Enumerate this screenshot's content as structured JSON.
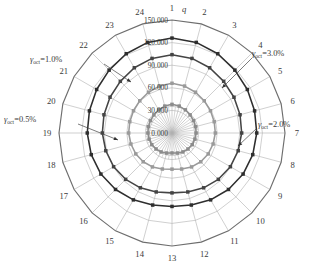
{
  "chart_data": {
    "type": "line",
    "subtype": "polar-radar",
    "title": "",
    "radial_axis_label": "q",
    "radial_ticks": [
      "0.000",
      "30.000",
      "60.000",
      "90.000",
      "120.000",
      "150.000"
    ],
    "radial_tick_values": [
      0,
      30000,
      60000,
      90000,
      120000,
      150000
    ],
    "rlim": [
      0,
      150000
    ],
    "grid": true,
    "legend_position": "annotations-on-plot",
    "angular_axis_label": "",
    "categories": [
      "1",
      "2",
      "3",
      "4",
      "5",
      "6",
      "7",
      "8",
      "9",
      "10",
      "11",
      "12",
      "13",
      "14",
      "15",
      "16",
      "17",
      "18",
      "19",
      "20",
      "21",
      "22",
      "23",
      "24"
    ],
    "angle_start_deg": 90,
    "angle_direction": "clockwise",
    "series": [
      {
        "name": "γoct=0.5%",
        "label_text": "=0.5%",
        "symbol": "γ",
        "subscript": "oct",
        "color": "#8c8c8c",
        "marker": "square",
        "values": [
          38000,
          37000,
          35500,
          34000,
          33000,
          32500,
          32000,
          31500,
          31000,
          30000,
          29000,
          27500,
          26500,
          27500,
          29000,
          30000,
          31000,
          31500,
          32000,
          32500,
          33000,
          34000,
          35500,
          37000
        ]
      },
      {
        "name": "γoct=1.0%",
        "label_text": "=1.0%",
        "symbol": "γ",
        "subscript": "oct",
        "color": "#9a9a9a",
        "marker": "square",
        "values": [
          66000,
          64500,
          62500,
          60500,
          59000,
          58000,
          57500,
          56500,
          55500,
          54000,
          52000,
          49500,
          48000,
          49500,
          52000,
          54000,
          55500,
          56500,
          57500,
          58000,
          59000,
          60500,
          62500,
          64500
        ]
      },
      {
        "name": "γoct=2.0%",
        "label_text": "=2.0%",
        "symbol": "γ",
        "subscript": "oct",
        "color": "#444444",
        "marker": "square",
        "values": [
          104000,
          102500,
          100000,
          97000,
          95000,
          93500,
          92500,
          91000,
          89500,
          87000,
          84000,
          81000,
          79500,
          81000,
          84000,
          87000,
          89500,
          91000,
          92500,
          93500,
          95000,
          97000,
          100000,
          102500
        ]
      },
      {
        "name": "γoct=3.0%",
        "label_text": "=3.0%",
        "symbol": "γ",
        "subscript": "oct",
        "color": "#2e2e2e",
        "marker": "square",
        "values": [
          126000,
          124500,
          121500,
          118000,
          115500,
          113500,
          112500,
          111000,
          109000,
          106000,
          102500,
          99000,
          97500,
          99000,
          102500,
          106000,
          109000,
          111000,
          112500,
          113500,
          115500,
          118000,
          121500,
          124500
        ]
      }
    ],
    "annotations": [
      {
        "id": "anno-0-5",
        "text": "=0.5%",
        "symbol": "γ",
        "subscript": "oct",
        "position": "left"
      },
      {
        "id": "anno-1-0",
        "text": "=1.0%",
        "symbol": "γ",
        "subscript": "oct",
        "position": "upper-left"
      },
      {
        "id": "anno-2-0",
        "text": "=2.0%",
        "symbol": "γ",
        "subscript": "oct",
        "position": "right"
      },
      {
        "id": "anno-3-0",
        "text": "=3.0%",
        "symbol": "γ",
        "subscript": "oct",
        "position": "upper-right"
      }
    ],
    "colors": {
      "grid": "#b0b0b0",
      "outer_ring": "#6e6e6e",
      "text": "#3a3a3a",
      "background": "#ffffff"
    }
  }
}
